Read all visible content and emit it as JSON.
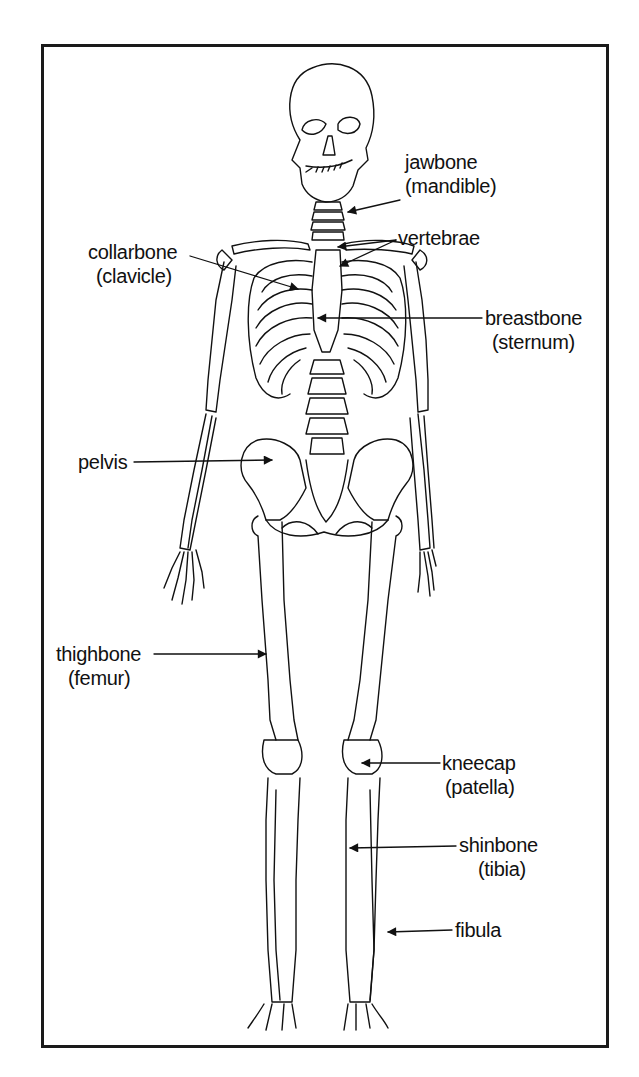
{
  "diagram": {
    "type": "labelled-anatomical-illustration",
    "colors": {
      "line": "#111111",
      "background": "#ffffff",
      "frame": "#1a1a1a"
    },
    "labels": [
      {
        "id": "jawbone",
        "common": "jawbone",
        "scientific": "(mandible)"
      },
      {
        "id": "vertebrae",
        "common": "vertebrae",
        "scientific": ""
      },
      {
        "id": "collarbone",
        "common": "collarbone",
        "scientific": "(clavicle)"
      },
      {
        "id": "breastbone",
        "common": "breastbone",
        "scientific": "(sternum)"
      },
      {
        "id": "pelvis",
        "common": "pelvis",
        "scientific": ""
      },
      {
        "id": "thighbone",
        "common": "thighbone",
        "scientific": "(femur)"
      },
      {
        "id": "kneecap",
        "common": "kneecap",
        "scientific": "(patella)"
      },
      {
        "id": "shinbone",
        "common": "shinbone",
        "scientific": "(tibia)"
      },
      {
        "id": "fibula",
        "common": "fibula",
        "scientific": ""
      }
    ]
  }
}
